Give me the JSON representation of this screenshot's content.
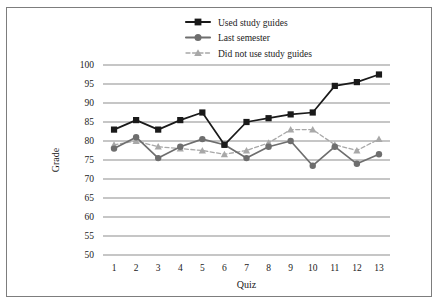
{
  "chart_data": {
    "type": "line",
    "title": "",
    "xlabel": "Quiz",
    "ylabel": "Grade",
    "categories": [
      "1",
      "2",
      "3",
      "4",
      "5",
      "6",
      "7",
      "8",
      "9",
      "10",
      "11",
      "12",
      "13"
    ],
    "x": [
      1,
      2,
      3,
      4,
      5,
      6,
      7,
      8,
      9,
      10,
      11,
      12,
      13
    ],
    "ylim": [
      50,
      100
    ],
    "xlim": [
      0.5,
      13.5
    ],
    "yticks": [
      50,
      55,
      60,
      65,
      70,
      75,
      80,
      85,
      90,
      95,
      100
    ],
    "grid": "horizontal",
    "legend_position": "top-center",
    "series": [
      {
        "name": "Used study guides",
        "marker": "square",
        "color": "#1a1a1a",
        "linestyle": "solid",
        "values": [
          83,
          85.5,
          83,
          85.5,
          87.5,
          79,
          85,
          86,
          87,
          87.5,
          94.5,
          95.5,
          97.5
        ]
      },
      {
        "name": "Last semester",
        "marker": "circle",
        "color": "#6e6e6e",
        "linestyle": "solid",
        "values": [
          78,
          81,
          75.5,
          78.5,
          80.5,
          79,
          75.5,
          78.5,
          80,
          73.5,
          78.5,
          74,
          76.5
        ]
      },
      {
        "name": "Did not use study guides",
        "marker": "triangle",
        "color": "#a8a8a8",
        "linestyle": "dashed",
        "values": [
          79,
          80,
          78.5,
          78,
          77.5,
          76.5,
          77.5,
          79.5,
          83,
          83,
          79,
          77.5,
          80.5
        ]
      }
    ]
  },
  "legend": {
    "items": [
      {
        "label": "Used study guides"
      },
      {
        "label": "Last semester"
      },
      {
        "label": "Did not use study guides"
      }
    ]
  },
  "axes": {
    "y_title": "Grade",
    "x_title": "Quiz",
    "y_ticks": [
      "100",
      "95",
      "90",
      "85",
      "80",
      "75",
      "70",
      "65",
      "60",
      "55",
      "50"
    ],
    "x_ticks": [
      "1",
      "2",
      "3",
      "4",
      "5",
      "6",
      "7",
      "8",
      "9",
      "10",
      "11",
      "12",
      "13"
    ]
  },
  "colors": {
    "series_1": "#1a1a1a",
    "series_2": "#6e6e6e",
    "series_3": "#a8a8a8",
    "grid": "#8d8d8d",
    "frame": "#7d7d7d",
    "text": "#1a1a1a"
  }
}
